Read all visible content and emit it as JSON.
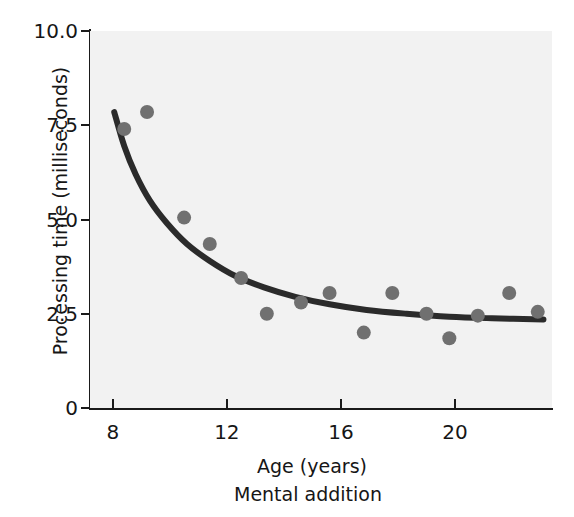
{
  "chart_data": {
    "type": "scatter",
    "title": "",
    "caption": "Mental addition",
    "xlabel": "Age (years)",
    "ylabel": "Processing time (milliseconds)",
    "xlim": [
      7.2,
      23.4
    ],
    "ylim": [
      0,
      10
    ],
    "xticks": [
      "8",
      "12",
      "16",
      "20"
    ],
    "xtick_values": [
      8,
      12,
      16,
      20
    ],
    "yticks": [
      "10.0",
      "7.5",
      "5.0",
      "2.5",
      "0"
    ],
    "ytick_values": [
      10.0,
      7.5,
      5.0,
      2.5,
      0
    ],
    "grid": false,
    "legend": "none",
    "points": [
      {
        "x": 8.4,
        "y": 7.4
      },
      {
        "x": 9.2,
        "y": 7.85
      },
      {
        "x": 10.5,
        "y": 5.05
      },
      {
        "x": 11.4,
        "y": 4.35
      },
      {
        "x": 12.5,
        "y": 3.45
      },
      {
        "x": 13.4,
        "y": 2.5
      },
      {
        "x": 14.6,
        "y": 2.8
      },
      {
        "x": 15.6,
        "y": 3.05
      },
      {
        "x": 16.8,
        "y": 2.0
      },
      {
        "x": 17.8,
        "y": 3.05
      },
      {
        "x": 19.0,
        "y": 2.5
      },
      {
        "x": 19.8,
        "y": 1.85
      },
      {
        "x": 20.8,
        "y": 2.45
      },
      {
        "x": 21.9,
        "y": 3.05
      },
      {
        "x": 22.9,
        "y": 2.55
      }
    ],
    "fit_curve": {
      "name": "exponential-decay-fit",
      "description": "Decreasing curve fitted through the data",
      "points": [
        {
          "x": 8.05,
          "y": 7.85
        },
        {
          "x": 8.4,
          "y": 6.95
        },
        {
          "x": 8.8,
          "y": 6.2
        },
        {
          "x": 9.3,
          "y": 5.5
        },
        {
          "x": 9.9,
          "y": 4.9
        },
        {
          "x": 10.6,
          "y": 4.35
        },
        {
          "x": 11.4,
          "y": 3.9
        },
        {
          "x": 12.3,
          "y": 3.5
        },
        {
          "x": 13.3,
          "y": 3.2
        },
        {
          "x": 14.4,
          "y": 2.95
        },
        {
          "x": 15.6,
          "y": 2.75
        },
        {
          "x": 16.9,
          "y": 2.6
        },
        {
          "x": 18.3,
          "y": 2.5
        },
        {
          "x": 19.8,
          "y": 2.42
        },
        {
          "x": 21.3,
          "y": 2.38
        },
        {
          "x": 23.1,
          "y": 2.35
        }
      ]
    },
    "colors": {
      "point_fill": "#707070",
      "curve": "#2b2b2b",
      "axis": "#1a1a1a",
      "plot_background": "#f2f2f2",
      "figure_background": "#ffffff",
      "text": "#161616"
    },
    "point_radius_px": 7
  }
}
